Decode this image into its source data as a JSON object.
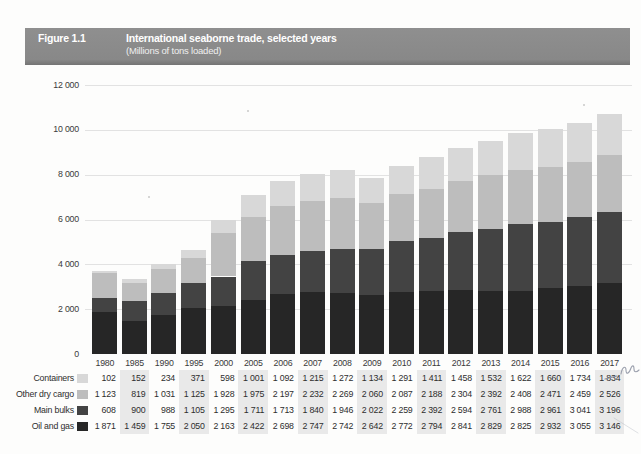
{
  "figure_header": {
    "label": "Figure 1.1",
    "title": "International seaborne trade, selected years",
    "subtitle": "(Millions of tons loaded)"
  },
  "chart_data": {
    "type": "bar",
    "stacked": true,
    "title": "International seaborne trade, selected years",
    "subtitle": "(Millions of tons loaded)",
    "unit": "millions of tons loaded",
    "categories": [
      1980,
      1985,
      1990,
      1995,
      2000,
      2005,
      2006,
      2007,
      2008,
      2009,
      2010,
      2011,
      2012,
      2013,
      2014,
      2015,
      2016,
      2017
    ],
    "series": [
      {
        "name": "Containers",
        "color": "#d8d8d8",
        "values": [
          102,
          152,
          234,
          371,
          598,
          1001,
          1092,
          1215,
          1272,
          1134,
          1291,
          1411,
          1458,
          1532,
          1622,
          1660,
          1734,
          1834
        ]
      },
      {
        "name": "Other dry cargo",
        "color": "#bdbdbd",
        "values": [
          1123,
          819,
          1031,
          1125,
          1928,
          1975,
          2197,
          2232,
          2269,
          2060,
          2087,
          2188,
          2304,
          2392,
          2408,
          2471,
          2459,
          2526
        ]
      },
      {
        "name": "Main bulks",
        "color": "#434343",
        "values": [
          608,
          900,
          988,
          1105,
          1295,
          1711,
          1713,
          1840,
          1946,
          2022,
          2259,
          2392,
          2594,
          2761,
          2988,
          2961,
          3041,
          3196
        ]
      },
      {
        "name": "Oil and gas",
        "color": "#262626",
        "values": [
          1871,
          1459,
          1755,
          2050,
          2163,
          2422,
          2698,
          2747,
          2742,
          2642,
          2772,
          2794,
          2841,
          2829,
          2825,
          2932,
          3055,
          3146
        ]
      }
    ],
    "stack_order_bottom_to_top": [
      "Oil and gas",
      "Main bulks",
      "Other dry cargo",
      "Containers"
    ],
    "ylim": [
      0,
      12000
    ],
    "yticks": [
      0,
      2000,
      4000,
      6000,
      8000,
      10000,
      12000
    ],
    "grid": "horizontal",
    "legend_position": "table-row-labels-left",
    "table_shaded_year_columns": [
      1985,
      1995,
      2005,
      2007,
      2009,
      2011,
      2013,
      2015,
      2017
    ],
    "number_format": "space-thousands-separator"
  },
  "marginalia": {
    "pen_squiggle_near_value": "1 834",
    "description": "illegible handwritten pen squiggle at right margin of table"
  }
}
